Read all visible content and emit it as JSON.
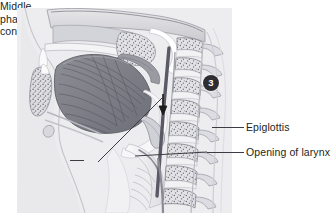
{
  "figure": {
    "step_badge": "3",
    "background_color": "#ffffff",
    "panel_color": "#ededef",
    "text_color": "#231f20",
    "leader_color": "#3c3c44",
    "badge_color": "#2f2d31",
    "badge_text_color": "#ffffff"
  },
  "labels": {
    "epiglottis": "Epiglottis",
    "opening_of_larynx": "Opening of larynx",
    "middle_pharyngeal_constrictor_line1": "Middle",
    "middle_pharyngeal_constrictor_line2": "pharyngeal",
    "middle_pharyngeal_constrictor_line3": "constrictor"
  },
  "annotations": {
    "arrow_direction": "down",
    "arrow_meaning": "bolus movement into pharynx"
  },
  "anatomy_regions": [
    "hard palate",
    "nasal cavity",
    "soft palate",
    "tongue",
    "oropharynx",
    "epiglottis",
    "larynx opening",
    "hyoid bone",
    "trachea",
    "cervical vertebrae",
    "spinal canal",
    "posterior pharyngeal wall",
    "mandible"
  ]
}
